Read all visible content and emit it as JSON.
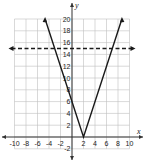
{
  "chart_data": {
    "type": "line",
    "title": "",
    "xlabel": "x",
    "ylabel": "y",
    "xlim": [
      -10,
      10
    ],
    "ylim": [
      -2,
      20
    ],
    "grid": true,
    "x_ticks": [
      -10,
      -8,
      -6,
      -4,
      -2,
      2,
      4,
      6,
      8,
      10
    ],
    "y_ticks": [
      -2,
      2,
      4,
      6,
      8,
      10,
      12,
      14,
      16,
      18,
      20
    ],
    "series": [
      {
        "name": "y = 3|x - 2|",
        "style": "solid",
        "points": [
          [
            -4.67,
            20
          ],
          [
            2,
            0
          ],
          [
            8.67,
            20
          ]
        ]
      },
      {
        "name": "y = 15",
        "style": "dashed",
        "points": [
          [
            -10,
            15
          ],
          [
            10,
            15
          ]
        ]
      }
    ],
    "colors": {
      "line": "#1a1a1a",
      "grid": "#bfbfbf",
      "axis": "#333333"
    }
  },
  "labels": {
    "x": "x",
    "y": "y"
  },
  "ticks": {
    "x": [
      "-10",
      "-8",
      "-6",
      "-4",
      "-2",
      "2",
      "4",
      "6",
      "8",
      "10"
    ],
    "y": [
      "-2",
      "2",
      "4",
      "6",
      "8",
      "10",
      "12",
      "14",
      "16",
      "18",
      "20"
    ]
  }
}
